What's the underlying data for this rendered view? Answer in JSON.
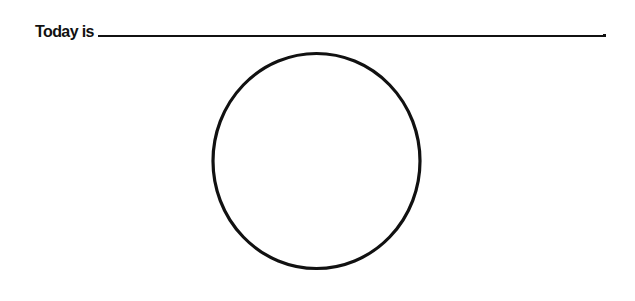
{
  "worksheet": {
    "prompt_label": "Today is",
    "answer_value": "",
    "terminal_punctuation": ".",
    "drawing_area": {
      "shape": "circle",
      "stroke_color": "#111111",
      "fill_color": "#ffffff"
    }
  }
}
